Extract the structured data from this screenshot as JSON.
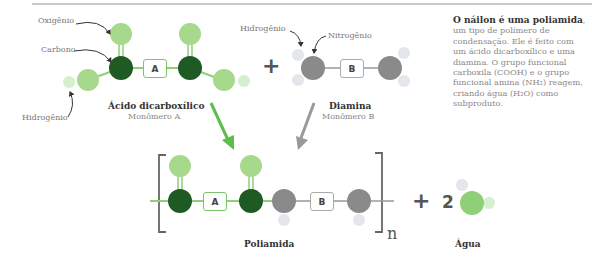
{
  "labels": {
    "oxigenio": "Oxigênio",
    "carbono": "Carbono",
    "hidrogenio_a": "Hidrogênio",
    "hidrogenio_b": "Hidrogênio",
    "nitrogenio": "Nitrogênio"
  },
  "monomer_a": {
    "title": "Ácido dicarboxílico",
    "subtitle": "Monômero A",
    "box": "A"
  },
  "monomer_b": {
    "title": "Diamina",
    "subtitle": "Monômero B",
    "box": "B"
  },
  "operators": {
    "plus": "+",
    "plus2": "+",
    "coef": "2"
  },
  "product": {
    "title": "Poliamida",
    "box_a": "A",
    "box_b": "B",
    "repeat": "n"
  },
  "byproduct": {
    "title": "Água"
  },
  "side_text": {
    "bold": "O náilon é uma poliamida",
    "rest": ", um tipo de polímero de condensação. Ele é feito com um ácido dicarboxílico e uma diamina. O grupo funcional carboxila (COOH) e o grupo funcional amina (NH₂) reagem, criando água (H₂O) como subproduto."
  },
  "colors": {
    "dark_green": "#1f5a25",
    "light_green": "#a6d98c",
    "mid_green": "#8fcf78",
    "pale_green": "#d6efcc",
    "gray_atom": "#8a8a8a",
    "pale_gray": "#e3e6ea",
    "arrow_green": "#5cbc4c",
    "arrow_gray": "#999999"
  }
}
